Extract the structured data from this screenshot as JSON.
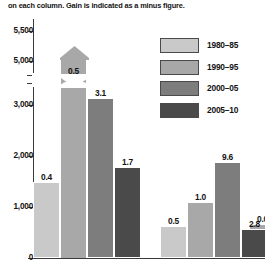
{
  "caption": "on each column. Gain is indicated as a minus figure.",
  "legend": {
    "position": "top-right",
    "items": [
      {
        "label": "1980–85",
        "color": "#c9c9c9"
      },
      {
        "label": "1990–95",
        "color": "#a8a8a8"
      },
      {
        "label": "2000–05",
        "color": "#7d7d7d"
      },
      {
        "label": "2005–10",
        "color": "#4a4a4a"
      }
    ]
  },
  "chart_data": {
    "type": "bar",
    "title": "",
    "xlabel": "",
    "ylabel": "",
    "ylim": [
      0,
      5500
    ],
    "grid": false,
    "axis_break": true,
    "axis_break_between": [
      3500,
      4800
    ],
    "ytick_labels": [
      "5,500",
      "5,000",
      "3,000",
      "2,000",
      "1,000",
      "0"
    ],
    "ytick_values": [
      5500,
      5000,
      3000,
      2000,
      1000,
      0
    ],
    "categories": [
      "group-1",
      "group-2",
      "group-3"
    ],
    "series": [
      {
        "name": "1980–85",
        "color": "#c9c9c9",
        "values": [
          1500,
          630,
          170
        ],
        "data_labels": [
          "0.4",
          "0.5",
          "0.3"
        ]
      },
      {
        "name": "1990–95",
        "color": "#a8a8a8",
        "values": [
          6200,
          1100,
          670
        ],
        "data_labels": [
          "0.5",
          "1.0",
          "0.0"
        ]
      },
      {
        "name": "2000–05",
        "color": "#7d7d7d",
        "values": [
          3150,
          1880,
          null
        ],
        "data_labels": [
          "3.1",
          "9.6",
          null
        ]
      },
      {
        "name": "2005–10",
        "color": "#4a4a4a",
        "values": [
          1790,
          570,
          null
        ],
        "data_labels": [
          "1.7",
          "2.8",
          null
        ]
      }
    ],
    "notes": [
      "The 1990–95 bar of group 1 exceeds the axis maximum and is drawn broken with an arrow head.",
      "Group 3 is clipped by the right edge of the figure; only two bars are visible."
    ]
  }
}
